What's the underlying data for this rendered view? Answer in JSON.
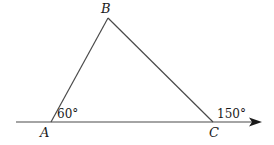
{
  "diagram": {
    "type": "geometry-triangle",
    "colors": {
      "line": "#4a4a4a",
      "text": "#1a1a1a",
      "background": "#ffffff"
    },
    "vertices": {
      "A": {
        "label": "A",
        "x": 51,
        "y": 122
      },
      "B": {
        "label": "B",
        "x": 108,
        "y": 18
      },
      "C": {
        "label": "C",
        "x": 213,
        "y": 122
      }
    },
    "angles": {
      "A": {
        "label": "60°",
        "value": 60
      },
      "C_exterior": {
        "label": "150°",
        "value": 150
      }
    },
    "baseline": {
      "x1": 16,
      "x2": 262,
      "y": 122,
      "arrow": "right"
    }
  }
}
